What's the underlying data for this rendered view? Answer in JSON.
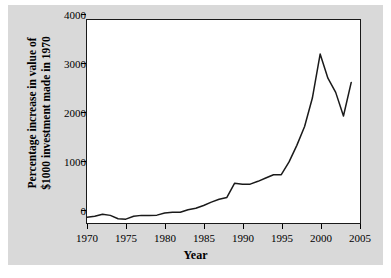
{
  "figure": {
    "background_color": "#d9d9d9",
    "plot_background_color": "#ffffff",
    "frame_color": "#1a1a1a",
    "line_color": "#1a1a1a"
  },
  "axes": {
    "xlabel": "Year",
    "ylabel_line1": "Percentage increase in value of",
    "ylabel_line2": "$1000 investment made in 1970",
    "xticks": [
      "1970",
      "1975",
      "1980",
      "1985",
      "1990",
      "1995",
      "2000",
      "2005"
    ],
    "yticks": [
      "0",
      "1000",
      "2000",
      "3000",
      "4000"
    ]
  },
  "chart_data": {
    "type": "line",
    "title": "",
    "xlabel": "Year",
    "ylabel": "Percentage increase in value of $1000 investment made in 1970",
    "xlim": [
      1970,
      2005
    ],
    "ylim": [
      -120,
      4150
    ],
    "xtick_values": [
      1970,
      1975,
      1980,
      1985,
      1990,
      1995,
      2000,
      2005
    ],
    "ytick_values": [
      0,
      1000,
      2000,
      3000,
      4000
    ],
    "grid": false,
    "legend": "none",
    "series": [
      {
        "name": "Percentage increase in value of $1000 investment made in 1970",
        "color": "#1a1a1a",
        "x": [
          1970,
          1971,
          1972,
          1973,
          1974,
          1975,
          1976,
          1977,
          1978,
          1979,
          1980,
          1981,
          1982,
          1983,
          1984,
          1985,
          1986,
          1987,
          1988,
          1989,
          1990,
          1991,
          1992,
          1993,
          1994,
          1995,
          1996,
          1997,
          1998,
          1999,
          2000,
          2001,
          2002,
          2003,
          2004
        ],
        "values": [
          -20,
          0,
          45,
          20,
          -50,
          -60,
          0,
          20,
          20,
          25,
          70,
          85,
          85,
          140,
          170,
          230,
          300,
          360,
          400,
          700,
          680,
          680,
          740,
          810,
          880,
          880,
          1150,
          1500,
          1900,
          2500,
          3430,
          2920,
          2620,
          2120,
          2830
        ]
      }
    ]
  }
}
